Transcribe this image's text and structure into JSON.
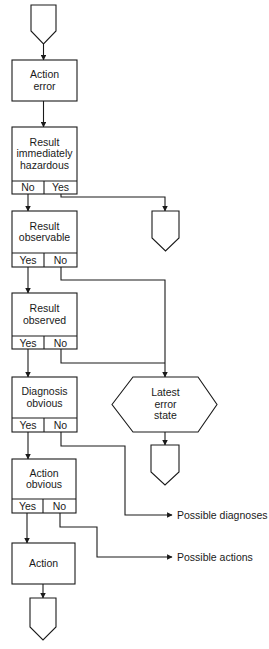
{
  "diagram": {
    "type": "flowchart",
    "stroke_color": "#1a1a1a",
    "background": "#ffffff",
    "nodes": {
      "start": {
        "shape": "off-page-connector"
      },
      "action_error": {
        "label": "Action error",
        "lines": [
          "Action",
          "error"
        ]
      },
      "immediately_hazardous": {
        "label": "Result immediately hazardous",
        "lines": [
          "Result",
          "immediately",
          "hazardous"
        ],
        "left": "No",
        "right": "Yes"
      },
      "hazard_end": {
        "shape": "off-page-connector"
      },
      "observable": {
        "label": "Result observable",
        "lines": [
          "Result",
          "observable"
        ],
        "left": "Yes",
        "right": "No"
      },
      "observed": {
        "label": "Result observed",
        "lines": [
          "Result",
          "observed"
        ],
        "left": "Yes",
        "right": "No"
      },
      "diagnosis_obvious": {
        "label": "Diagnosis obvious",
        "lines": [
          "Diagnosis",
          "obvious"
        ],
        "left": "Yes",
        "right": "No"
      },
      "latest_error_state": {
        "label": "Latest error state",
        "lines": [
          "Latest",
          "error",
          "state"
        ],
        "shape": "hexagon"
      },
      "latest_end": {
        "shape": "off-page-connector"
      },
      "action_obvious": {
        "label": "Action obvious",
        "lines": [
          "Action",
          "obvious"
        ],
        "left": "Yes",
        "right": "No"
      },
      "action": {
        "label": "Action",
        "lines": [
          "Action"
        ]
      },
      "end": {
        "shape": "off-page-connector"
      }
    },
    "outputs": {
      "possible_diagnoses": "Possible diagnoses",
      "possible_actions": "Possible actions"
    },
    "edges": [
      {
        "from": "start",
        "to": "action_error"
      },
      {
        "from": "action_error",
        "to": "immediately_hazardous"
      },
      {
        "from": "immediately_hazardous",
        "to": "observable",
        "condition": "No"
      },
      {
        "from": "immediately_hazardous",
        "to": "hazard_end",
        "condition": "Yes"
      },
      {
        "from": "observable",
        "to": "observed",
        "condition": "Yes"
      },
      {
        "from": "observable",
        "to": "latest_error_state",
        "condition": "No"
      },
      {
        "from": "observed",
        "to": "diagnosis_obvious",
        "condition": "Yes"
      },
      {
        "from": "observed",
        "to": "latest_error_state",
        "condition": "No"
      },
      {
        "from": "latest_error_state",
        "to": "latest_end"
      },
      {
        "from": "diagnosis_obvious",
        "to": "action_obvious",
        "condition": "Yes"
      },
      {
        "from": "diagnosis_obvious",
        "to": "possible_diagnoses",
        "condition": "No"
      },
      {
        "from": "action_obvious",
        "to": "action",
        "condition": "Yes"
      },
      {
        "from": "action_obvious",
        "to": "possible_actions",
        "condition": "No"
      },
      {
        "from": "action",
        "to": "end"
      }
    ]
  }
}
